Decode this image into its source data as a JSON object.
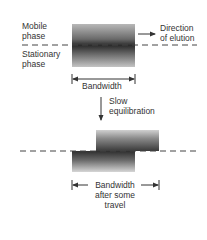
{
  "diagram": {
    "top_panel": {
      "labels": {
        "mobile_phase_line1": "Mobile",
        "mobile_phase_line2": "phase",
        "stationary_phase_line1": "Stationary",
        "stationary_phase_line2": "phase",
        "direction_line1": "Direction",
        "direction_line2": "of elution",
        "bandwidth": "Bandwidth"
      }
    },
    "transition": {
      "label_line1": "Slow",
      "label_line2": "equilibration"
    },
    "bottom_panel": {
      "labels": {
        "bandwidth_line1": "Bandwidth",
        "bandwidth_line2": "after some",
        "bandwidth_line3": "travel"
      }
    },
    "colors": {
      "band_dark": "#2c2c2c",
      "line": "#444444",
      "text": "#333333"
    }
  }
}
